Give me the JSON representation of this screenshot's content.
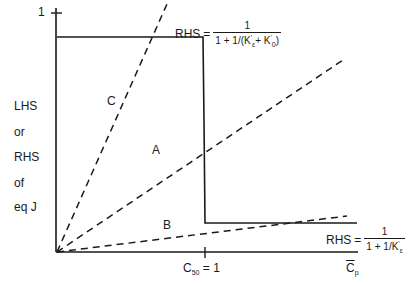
{
  "diagram": {
    "y_axis": {
      "tick_label": "1",
      "label_lines": [
        "LHS",
        "or",
        "RHS",
        "of",
        "eq J"
      ]
    },
    "x_axis": {
      "tick_label_main": "C",
      "tick_label_sub": "50",
      "tick_label_rest": "= 1",
      "axis_label_main": "C",
      "axis_label_sub": "p"
    },
    "lines": {
      "A": "A",
      "B": "B",
      "C": "C"
    },
    "rhs_high": {
      "lhs": "RHS",
      "eq": "=",
      "numerator": "1",
      "denominator_prefix": "1 + 1/(K",
      "denominator_sub1": "ε",
      "denominator_mid": "+ K",
      "denominator_sub2": "0",
      "denominator_suffix": ")"
    },
    "rhs_low": {
      "lhs": "RHS",
      "eq": "=",
      "numerator": "1",
      "denominator_prefix": "1 + 1/K",
      "denominator_sub": "ε"
    },
    "colors": {
      "ink": "#1a1a1a",
      "background": "#ffffff"
    }
  }
}
